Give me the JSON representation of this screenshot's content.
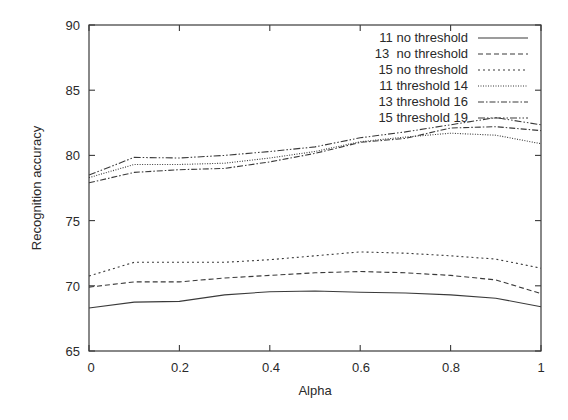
{
  "chart_data": {
    "type": "line",
    "title": "",
    "xlabel": "Alpha",
    "ylabel": "Recognition accuracy",
    "xlim": [
      0,
      1
    ],
    "ylim": [
      65,
      90
    ],
    "grid": false,
    "legend_position": "upper right (inside)",
    "x": [
      0,
      0.1,
      0.2,
      0.3,
      0.4,
      0.5,
      0.6,
      0.7,
      0.8,
      0.9,
      1.0
    ],
    "x_ticks": [
      "0",
      "0.2",
      "0.4",
      "0.6",
      "0.8",
      "1"
    ],
    "y_ticks": [
      "65",
      "70",
      "75",
      "80",
      "85",
      "90"
    ],
    "series": [
      {
        "name": "11 no threshold",
        "style": "solid",
        "values": [
          68.3,
          68.75,
          68.8,
          69.3,
          69.55,
          69.6,
          69.5,
          69.45,
          69.3,
          69.05,
          68.4
        ]
      },
      {
        "name": "13  no threshold",
        "style": "dashed",
        "values": [
          69.9,
          70.3,
          70.3,
          70.6,
          70.8,
          71.0,
          71.1,
          71.0,
          70.8,
          70.45,
          69.4
        ]
      },
      {
        "name": "15 no threshold",
        "style": "dotted",
        "values": [
          70.75,
          71.8,
          71.8,
          71.8,
          72.0,
          72.3,
          72.6,
          72.5,
          72.3,
          72.05,
          71.35
        ]
      },
      {
        "name": "11 threshold 14",
        "style": "fine-dotted",
        "values": [
          78.3,
          79.3,
          79.3,
          79.4,
          79.8,
          80.3,
          81.05,
          81.4,
          81.7,
          81.55,
          80.9
        ]
      },
      {
        "name": "13 threshold 16",
        "style": "dash-dot",
        "values": [
          77.9,
          78.7,
          78.9,
          79.0,
          79.5,
          80.15,
          81.0,
          81.3,
          82.1,
          82.2,
          81.9
        ]
      },
      {
        "name": "15 threshold 19",
        "style": "dash-dot-dot",
        "values": [
          78.5,
          79.85,
          79.8,
          80.0,
          80.3,
          80.65,
          81.35,
          81.8,
          82.35,
          82.9,
          82.35
        ]
      }
    ]
  },
  "axes": {
    "xlabel": "Alpha",
    "ylabel": "Recognition accuracy",
    "x_ticks": [
      "0",
      "0.2",
      "0.4",
      "0.6",
      "0.8",
      "1"
    ],
    "y_ticks": [
      "65",
      "70",
      "75",
      "80",
      "85",
      "90"
    ]
  },
  "legend": {
    "items": [
      {
        "label": "11 no threshold"
      },
      {
        "label": "13  no threshold"
      },
      {
        "label": "15 no threshold"
      },
      {
        "label": "11 threshold 14"
      },
      {
        "label": "13 threshold 16"
      },
      {
        "label": "15 threshold 19"
      }
    ]
  },
  "colors": {
    "line": "#3a3a3a",
    "text": "#2a2a2a",
    "background": "#ffffff"
  }
}
